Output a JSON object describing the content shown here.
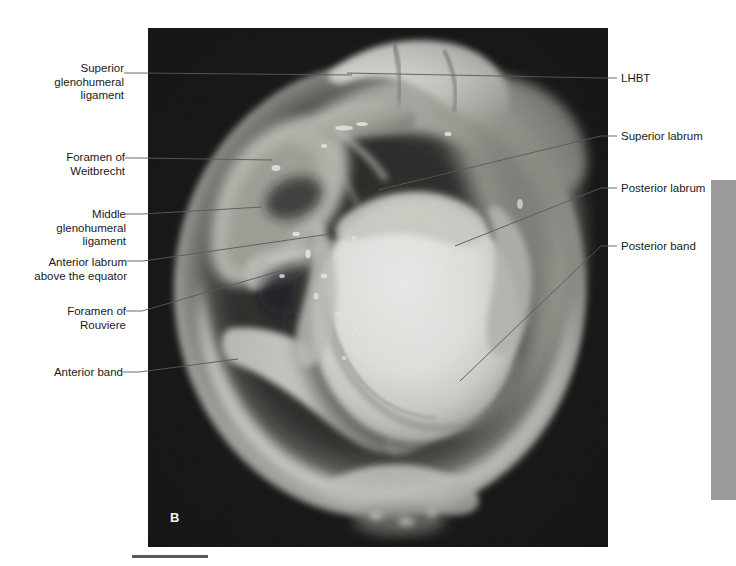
{
  "figure": {
    "panel_letter": "B",
    "background_color": "#ffffff",
    "plate_color": "#040404",
    "leader_color": "#595959",
    "text_color": "#1a1a1a",
    "page_tab_color": "#9b9b9b",
    "scale_bar_color": "#5a5a5a"
  },
  "labels_left": [
    {
      "id": "superior-glenohumeral-ligament",
      "lines": [
        "Superior",
        "glenohumeral",
        "ligament"
      ],
      "text": "Superior\nglenohumeral\nligament",
      "x": 68,
      "y": 62,
      "anchor_x": 124,
      "anchor_y": 73,
      "target_x": 352,
      "target_y": 75
    },
    {
      "id": "foramen-of-weitbrecht",
      "lines": [
        "Foramen of",
        "Weitbrecht"
      ],
      "text": "Foramen of\nWeitbrecht",
      "x": 57,
      "y": 151,
      "anchor_x": 125,
      "anchor_y": 158,
      "target_x": 272,
      "target_y": 160
    },
    {
      "id": "middle-glenohumeral-ligament",
      "lines": [
        "Middle",
        "glenohumeral",
        "ligament"
      ],
      "text": "Middle\nglenohumeral\nligament",
      "x": 80,
      "y": 208,
      "anchor_x": 126,
      "anchor_y": 214,
      "target_x": 262,
      "target_y": 207
    },
    {
      "id": "anterior-labrum-above-the-equator",
      "lines": [
        "Anterior labrum",
        "above the equator"
      ],
      "text": "Anterior labrum\nabove the equator",
      "x": 23,
      "y": 256,
      "anchor_x": 127,
      "anchor_y": 261,
      "target_x": 330,
      "target_y": 234
    },
    {
      "id": "foramen-of-rouviere",
      "lines": [
        "Foramen of",
        "Rouviere"
      ],
      "text": "Foramen of\nRouviere",
      "x": 56,
      "y": 305,
      "anchor_x": 126,
      "anchor_y": 311,
      "target_x": 280,
      "target_y": 271
    },
    {
      "id": "anterior-band",
      "lines": [
        "Anterior band"
      ],
      "text": "Anterior band",
      "x": 46,
      "y": 366,
      "anchor_x": 123,
      "anchor_y": 372,
      "target_x": 238,
      "target_y": 359
    }
  ],
  "labels_right": [
    {
      "id": "lhbt",
      "lines": [
        "LHBT"
      ],
      "text": "LHBT",
      "x": 621,
      "y": 72,
      "anchor_x": 617,
      "anchor_y": 78,
      "target_x": 347,
      "target_y": 73
    },
    {
      "id": "superior-labrum",
      "lines": [
        "Superior labrum"
      ],
      "text": "Superior labrum",
      "x": 621,
      "y": 130,
      "anchor_x": 617,
      "anchor_y": 136,
      "target_x": 378,
      "target_y": 190
    },
    {
      "id": "posterior-labrum",
      "lines": [
        "Posterior labrum"
      ],
      "text": "Posterior labrum",
      "x": 621,
      "y": 182,
      "anchor_x": 617,
      "anchor_y": 188,
      "target_x": 455,
      "target_y": 246
    },
    {
      "id": "posterior-band",
      "lines": [
        "Posterior band"
      ],
      "text": "Posterior band",
      "x": 621,
      "y": 240,
      "anchor_x": 617,
      "anchor_y": 246,
      "target_x": 460,
      "target_y": 381
    }
  ],
  "plate": {
    "left": 148,
    "top": 28,
    "width": 460,
    "height": 519
  },
  "page_tab": {
    "left": 711,
    "top": 180,
    "width": 25,
    "height": 320
  },
  "scale_bar": {
    "left": 132,
    "top": 555,
    "width": 76,
    "height": 3
  }
}
